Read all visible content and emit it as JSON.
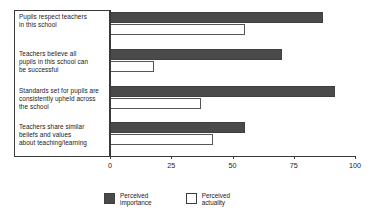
{
  "chart_data": {
    "type": "bar",
    "orientation": "horizontal",
    "title": "",
    "xlabel": "",
    "ylabel": "",
    "xlim": [
      0,
      100
    ],
    "xticks": [
      0,
      25,
      50,
      75,
      100
    ],
    "xtick_labels": [
      "0",
      "25",
      "50",
      "75",
      "100"
    ],
    "grid": false,
    "legend_position": "bottom",
    "categories": [
      "Pupils respect teachers in this school",
      "Teachers believe all pupils in this school can be successful",
      "Standards set for pupils are consistently upheld across the school",
      "Teachers share similar beliefs and values about teaching/learning"
    ],
    "category_lines": [
      [
        "Pupils respect teachers",
        "in this school"
      ],
      [
        "Teachers believe all",
        "pupils in this school can",
        "be successful"
      ],
      [
        "Standards set for pupils are",
        "consistently upheld across",
        "the school"
      ],
      [
        "Teachers share similar",
        "beliefs and values",
        "about teaching/learning"
      ]
    ],
    "series": [
      {
        "name": "Perceived importance",
        "color": "#4a4a4a",
        "values": [
          87,
          70,
          92,
          55
        ]
      },
      {
        "name": "Perceived actuality",
        "color": "#ffffff",
        "values": [
          55,
          18,
          37,
          42
        ]
      }
    ]
  },
  "legend": {
    "items": [
      {
        "label": "Perceived\nimportance",
        "style": "filled"
      },
      {
        "label": "Perceived\nactuality",
        "style": "hollow"
      }
    ]
  },
  "colors": {
    "importance_fill": "#4a4a4a",
    "actuality_fill": "#ffffff",
    "axis": "#3a3a3a",
    "text": "#1a1a1a",
    "background": "#ffffff"
  }
}
